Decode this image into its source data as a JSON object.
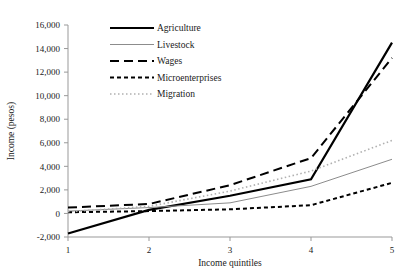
{
  "chart_data": {
    "type": "line",
    "title": "",
    "subtitle": "",
    "xlabel": "Income quintiles",
    "ylabel": "Income (pesos)",
    "x": [
      1,
      2,
      3,
      4,
      5
    ],
    "categories": [
      "1",
      "2",
      "3",
      "4",
      "5"
    ],
    "xtick_labels": [
      "1",
      "2",
      "3",
      "4",
      "5"
    ],
    "ytick_labels": [
      "-2,000",
      "0",
      "2,000",
      "4,000",
      "6,000",
      "8,000",
      "10,000",
      "12,000",
      "14,000",
      "16,000"
    ],
    "ytick_values": [
      -2000,
      0,
      2000,
      4000,
      6000,
      8000,
      10000,
      12000,
      14000,
      16000
    ],
    "ylim": [
      -2000,
      16000
    ],
    "xlim": [
      1,
      5
    ],
    "grid": false,
    "legend_position": "top-center",
    "series": [
      {
        "name": "Agriculture",
        "values": [
          -1700,
          300,
          1500,
          2900,
          14500
        ],
        "style": "solid",
        "color": "#000000",
        "width": 2.2,
        "dasharray": ""
      },
      {
        "name": "Livestock",
        "values": [
          200,
          500,
          900,
          2300,
          4600
        ],
        "style": "solid",
        "color": "#8c8c8c",
        "width": 1.0,
        "dasharray": ""
      },
      {
        "name": "Wages",
        "values": [
          500,
          800,
          2400,
          4700,
          13200
        ],
        "style": "long-dash",
        "color": "#000000",
        "width": 2.0,
        "dasharray": "9,5"
      },
      {
        "name": "Microenterprises",
        "values": [
          100,
          200,
          350,
          700,
          2600
        ],
        "style": "short-dash",
        "color": "#000000",
        "width": 2.0,
        "dasharray": "4,3"
      },
      {
        "name": "Migration",
        "values": [
          150,
          600,
          1900,
          3600,
          6200
        ],
        "style": "dotted",
        "color": "#b0b0b0",
        "width": 1.6,
        "dasharray": "1.5,2.5"
      }
    ]
  },
  "axes": {
    "y_title": "Income (pesos)",
    "x_title": "Income quintiles"
  },
  "legend": {
    "items": [
      {
        "label": "Agriculture"
      },
      {
        "label": "Livestock"
      },
      {
        "label": "Wages"
      },
      {
        "label": "Microenterprises"
      },
      {
        "label": "Migration"
      }
    ]
  },
  "colors": {
    "axis": "#999999",
    "text": "#1a1a1a",
    "background": "#ffffff"
  }
}
